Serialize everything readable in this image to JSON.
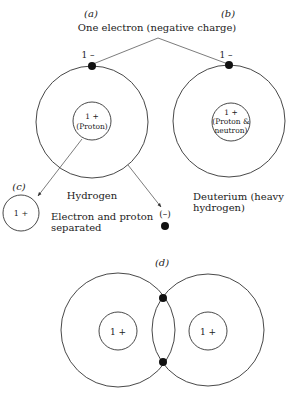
{
  "panels": {
    "a": {
      "label": "(a)",
      "atom_name": "Hydrogen",
      "nucleus_charge": "1 +",
      "nucleus_desc": "(Proton)",
      "electron_charge": "1 –"
    },
    "b": {
      "label": "(b)",
      "atom_name_line1": "Deuterium (heavy",
      "atom_name_line2": "hydrogen)",
      "nucleus_charge": "1 +",
      "nucleus_desc_line1": "(Proton &",
      "nucleus_desc_line2": "neutron)",
      "electron_charge": "1 –"
    },
    "c": {
      "label": "(c)",
      "ion_charge": "1 +",
      "caption_line1": "Electron and proton",
      "caption_line2": "separated",
      "free_electron_charge": "(–)"
    },
    "d": {
      "label": "(d)",
      "left_nucleus_charge": "1 +",
      "right_nucleus_charge": "1 +"
    }
  },
  "shared_caption": "One electron (negative charge)",
  "colors": {
    "line": "#333333",
    "electron": "#111111",
    "text": "#222222",
    "background": "#ffffff"
  }
}
